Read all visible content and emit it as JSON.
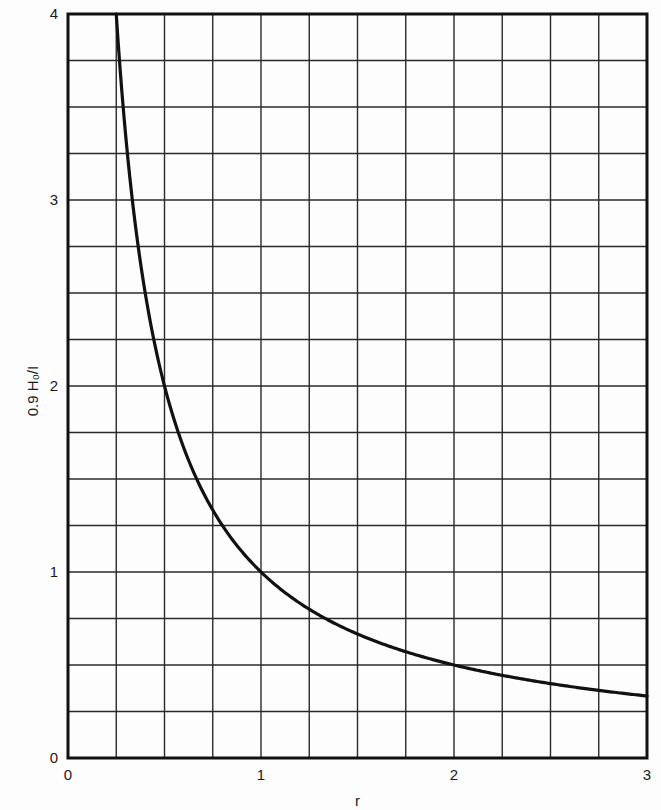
{
  "chart_data": {
    "type": "line",
    "title": "",
    "xlabel": "r",
    "ylabel": "0.9 H₀/I",
    "xlim": [
      0,
      3
    ],
    "ylim": [
      0,
      4
    ],
    "grid": true,
    "grid_step_x": 0.25,
    "grid_step_y": 0.25,
    "x_ticks": [
      0,
      1,
      2,
      3
    ],
    "x_tick_labels": [
      "0",
      "1",
      "2",
      "3"
    ],
    "y_ticks": [
      0,
      1,
      2,
      3,
      4
    ],
    "y_tick_labels": [
      "0",
      "1",
      "2",
      "3",
      "4"
    ],
    "legend": null,
    "series": [
      {
        "name": "0.9 H0/I = 1/r",
        "color": "#111111",
        "x": [
          0.25,
          0.3,
          0.35,
          0.4,
          0.5,
          0.6,
          0.75,
          0.9,
          1.0,
          1.25,
          1.5,
          1.75,
          2.0,
          2.25,
          2.5,
          2.75,
          3.0
        ],
        "y": [
          4.0,
          3.333,
          2.857,
          2.5,
          2.0,
          1.667,
          1.333,
          1.111,
          1.0,
          0.8,
          0.667,
          0.571,
          0.5,
          0.444,
          0.4,
          0.364,
          0.333
        ]
      }
    ]
  },
  "colors": {
    "background": "#fdfdfd",
    "ink": "#111111",
    "grid": "#2a2a2a"
  }
}
